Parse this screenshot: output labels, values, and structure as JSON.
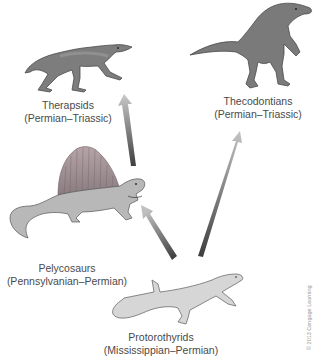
{
  "diagram": {
    "type": "evolutionary-relationship",
    "nodes": [
      {
        "id": "therapsids",
        "name": "Therapsids",
        "period": "(Permian–Triassic)",
        "icon": "therapsid-illustration-icon"
      },
      {
        "id": "thecodontians",
        "name": "Thecodontians",
        "period": "(Permian–Triassic)",
        "icon": "thecodont-illustration-icon"
      },
      {
        "id": "pelycosaurs",
        "name": "Pelycosaurs",
        "period": "(Pennsylvanian–Permian)",
        "icon": "dimetrodon-illustration-icon"
      },
      {
        "id": "protorothyrids",
        "name": "Protorothyrids",
        "period": "(Mississippian–Permian)",
        "icon": "lizard-illustration-icon"
      }
    ],
    "edges": [
      {
        "from": "protorothyrids",
        "to": "pelycosaurs"
      },
      {
        "from": "protorothyrids",
        "to": "thecodontians"
      },
      {
        "from": "pelycosaurs",
        "to": "therapsids"
      }
    ],
    "credit": "© 2013 Cengage Learning"
  },
  "colors": {
    "animal_fill": "#8c8c8c",
    "animal_dark": "#5a5a5a",
    "lizard_fill": "#d2d2d2",
    "arrow_dark": "#4a4a4a",
    "arrow_light": "#c8c8c8",
    "text": "#4a4a4a"
  }
}
